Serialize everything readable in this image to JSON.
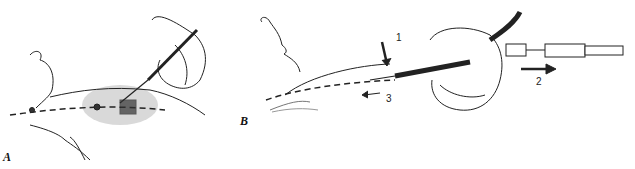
{
  "figure": {
    "panels": [
      {
        "label": "A",
        "description": "Needle inserted into shaded area of flexed arm along dashed vein line, hand holding syringe"
      },
      {
        "label": "B",
        "description": "Needle advanced along dashed line under skin, hand holding syringe attached to tubing, numbered steps"
      }
    ],
    "step_labels": {
      "one": "1",
      "two": "2",
      "three": "3"
    }
  }
}
